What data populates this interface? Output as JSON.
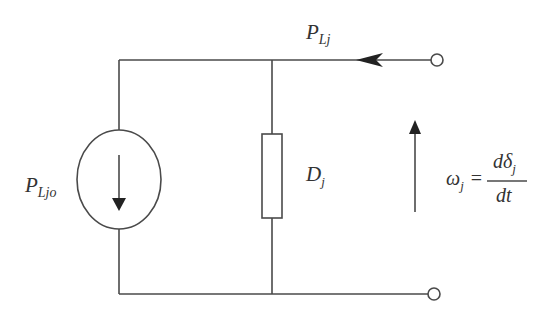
{
  "diagram": {
    "type": "equivalent-circuit",
    "colors": {
      "line": "#4a4a4a",
      "text": "#333333",
      "background": "#ffffff"
    },
    "labels": {
      "top_flow": {
        "main": "P",
        "sub": "Lj"
      },
      "source": {
        "main": "P",
        "sub": "Ljo"
      },
      "damping": {
        "main": "D",
        "sub": "j"
      },
      "equation": {
        "lhs_main": "ω",
        "lhs_sub": "j",
        "equals": "=",
        "numerator_main": "dδ",
        "numerator_sub": "j",
        "denominator": "dt"
      }
    },
    "components": [
      {
        "name": "current-source",
        "arrow": "down"
      },
      {
        "name": "resistor",
        "label": "D_j"
      },
      {
        "name": "terminal-top"
      },
      {
        "name": "terminal-bottom"
      },
      {
        "name": "flow-arrow",
        "direction": "left"
      },
      {
        "name": "frequency-arrow",
        "direction": "up"
      }
    ]
  }
}
